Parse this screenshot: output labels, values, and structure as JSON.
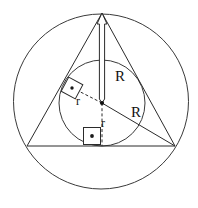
{
  "figure": {
    "background_color": "#ffffff",
    "stroke_color": "#2b2b2b",
    "width": 198,
    "height": 208
  },
  "labels": {
    "circumradius_top": "R",
    "circumradius_right": "R",
    "inradius_left": "r",
    "inradius_bottom": "r"
  },
  "shapes": {
    "circumcircle": {
      "name": "circumcircle",
      "cx": 101,
      "cy": 101.5,
      "r": 87.5
    },
    "incircle": {
      "name": "incircle",
      "cx": 102,
      "cy": 103,
      "r": 43
    },
    "triangle": {
      "name": "inscribed-triangle",
      "apex": {
        "x": 102,
        "y": 13
      },
      "left_vertex": {
        "x": 27,
        "y": 146
      },
      "right_vertex": {
        "x": 175,
        "y": 146
      }
    },
    "center_point": {
      "x": 102,
      "y": 103
    },
    "circumradius_segment_top": {
      "from": {
        "x": 102,
        "y": 13
      },
      "to": {
        "x": 102,
        "y": 103
      }
    },
    "circumradius_segment_right": {
      "from": {
        "x": 102,
        "y": 103
      },
      "to": {
        "x": 175,
        "y": 146
      }
    },
    "inradius_segment_left": {
      "from": {
        "x": 102,
        "y": 103
      },
      "to": {
        "x": 71.7,
        "y": 87.5
      }
    },
    "inradius_segment_bottom": {
      "from": {
        "x": 102,
        "y": 103
      },
      "to": {
        "x": 102,
        "y": 146
      }
    },
    "right_angle_mark_left": {
      "x": 72,
      "y": 88,
      "size": 16,
      "rotation": -62
    },
    "right_angle_mark_bottom": {
      "x": 92,
      "y": 136,
      "size": 17,
      "rotation": 0
    }
  },
  "label_positions": {
    "circumradius_top": {
      "x": 115,
      "y": 81
    },
    "circumradius_right": {
      "x": 131,
      "y": 117
    },
    "inradius_left": {
      "x": 76,
      "y": 105
    },
    "inradius_bottom": {
      "x": 101,
      "y": 127
    }
  }
}
